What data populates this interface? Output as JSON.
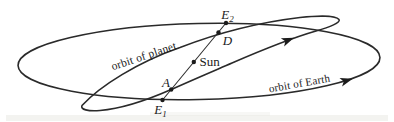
{
  "colors": {
    "ink": "#2a2a2a",
    "background": "#ffffff",
    "artifact_band": "#e7e7e2"
  },
  "labels": {
    "e2": {
      "main": "E",
      "sub": "2"
    },
    "d": "D",
    "sun": "Sun",
    "a": "A",
    "e1": {
      "main": "E",
      "sub": "1"
    },
    "orbit_planet": "orbit of planet",
    "orbit_earth": "orbit of Earth"
  }
}
